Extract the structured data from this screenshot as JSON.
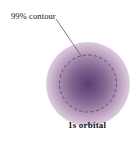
{
  "figure": {
    "background_color": "#ffffff",
    "annotations": {
      "contour_label": "99% contour",
      "orbital_label": "1s orbital"
    },
    "colors": {
      "cloud_center": "#5e3f73",
      "cloud_mid": "#a98bb0",
      "cloud_outer": "#ffffff",
      "contour_stroke": "#5a5a5e",
      "leader_stroke": "#6e6e74",
      "text": "#171717"
    },
    "geometry": {
      "contour_circle": {
        "cx": 88,
        "cy": 83.5,
        "r": 28.5,
        "dash": "3.2 2.4"
      },
      "cloud": {
        "cx": 88,
        "cy": 84,
        "r": 42
      },
      "leader_line": {
        "x1": 56,
        "y1": 19,
        "x2": 82,
        "y2": 57
      }
    }
  }
}
